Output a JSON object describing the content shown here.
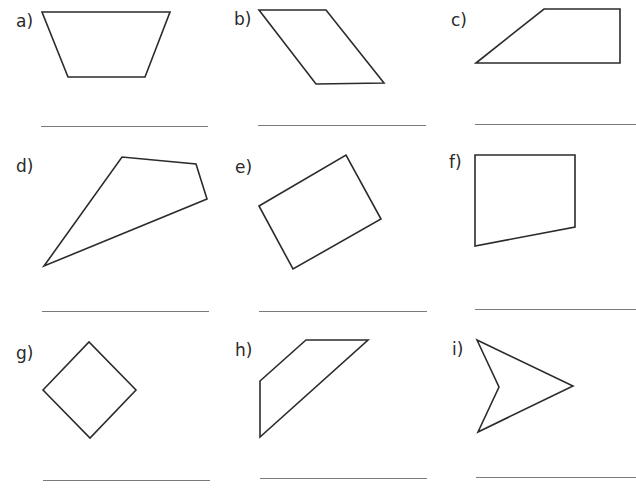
{
  "worksheet": {
    "items": [
      {
        "label": "a)",
        "shape": "trapezium",
        "points": "42,12 170,12 145,77 68,77",
        "label_pos": [
          16,
          13
        ],
        "line": {
          "x": 41,
          "y": 126,
          "w": 167
        }
      },
      {
        "label": "b)",
        "shape": "parallelogram",
        "points": "259,10 326,10 384,83 316,84",
        "label_pos": [
          234,
          11
        ],
        "line": {
          "x": 258,
          "y": 125,
          "w": 168
        }
      },
      {
        "label": "c)",
        "shape": "right-trapezium",
        "points": "476,63 544,9 620,9 620,63",
        "label_pos": [
          451,
          12
        ],
        "line": {
          "x": 475,
          "y": 124,
          "w": 161
        }
      },
      {
        "label": "d)",
        "shape": "irregular-quadrilateral",
        "points": "44,266 122,157 196,164 207,199",
        "label_pos": [
          16,
          158
        ],
        "line": {
          "x": 42,
          "y": 311,
          "w": 167
        }
      },
      {
        "label": "e)",
        "shape": "rectangle",
        "points": "259,206 346,155 381,219 293,269",
        "label_pos": [
          235,
          159
        ],
        "line": {
          "x": 259,
          "y": 311,
          "w": 168
        }
      },
      {
        "label": "f)",
        "shape": "right-trapezium",
        "points": "475,155 575,155 575,227 475,246",
        "label_pos": [
          449,
          154
        ],
        "line": {
          "x": 475,
          "y": 309,
          "w": 161
        }
      },
      {
        "label": "g)",
        "shape": "square",
        "points": "43,390 89,342 136,390 90,438",
        "label_pos": [
          16,
          345
        ],
        "line": {
          "x": 43,
          "y": 480,
          "w": 167
        }
      },
      {
        "label": "h)",
        "shape": "trapezium",
        "points": "260,381 306,340 368,340 260,437",
        "label_pos": [
          235,
          342
        ],
        "line": {
          "x": 260,
          "y": 478,
          "w": 167
        }
      },
      {
        "label": "i)",
        "shape": "arrowhead",
        "points": "477,340 573,386 478,432 499,387",
        "label_pos": [
          452,
          341
        ],
        "line": {
          "x": 476,
          "y": 477,
          "w": 160
        }
      }
    ]
  }
}
